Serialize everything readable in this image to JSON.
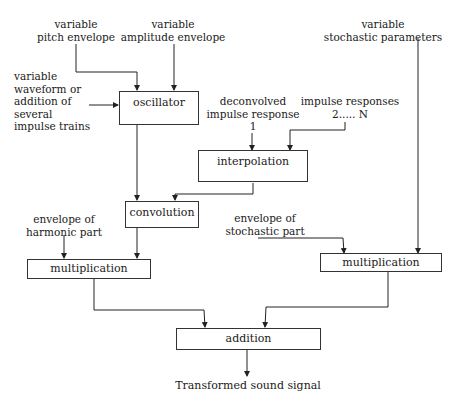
{
  "diagram": {
    "inputs": {
      "pitch_envelope": [
        "variable",
        "pitch envelope"
      ],
      "amplitude_envelope": [
        "variable",
        "amplitude envelope"
      ],
      "waveform": [
        "variable",
        "waveform or",
        "addition of",
        "several",
        "impulse trains"
      ],
      "stochastic_parameters": [
        "variable",
        "stochastic parameters"
      ],
      "deconvolved_ir": [
        "deconvolved",
        "impulse response",
        "1"
      ],
      "impulse_responses": [
        "impulse responses",
        "2..... N"
      ],
      "harmonic_envelope": [
        "envelope of",
        "harmonic part"
      ],
      "stochastic_envelope": [
        "envelope of",
        "stochastic part"
      ]
    },
    "blocks": {
      "oscillator": "oscillator",
      "interpolation": "interpolation",
      "convolution": "convolution",
      "multiplication_harmonic": "multiplication",
      "multiplication_stochastic": "multiplication",
      "addition": "addition"
    },
    "output": "Transformed sound signal"
  }
}
